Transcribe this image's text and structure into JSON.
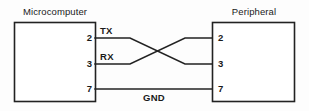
{
  "diagram": {
    "title_left": "Microcomputer",
    "title_right": "Peripheral",
    "left_pins": [
      "2",
      "3",
      "7"
    ],
    "right_pins": [
      "2",
      "3",
      "7"
    ],
    "signals": {
      "tx": "TX",
      "rx": "RX",
      "gnd": "GND"
    },
    "colors": {
      "line": "#222222",
      "text": "#1a1a1a",
      "background": "#fdfdfd"
    }
  }
}
